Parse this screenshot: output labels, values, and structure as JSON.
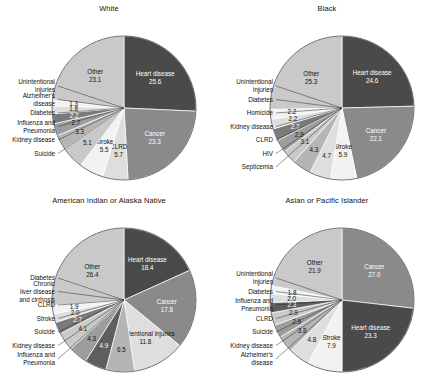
{
  "figure": {
    "type": "pie-grid",
    "rows": 2,
    "cols": 2,
    "background": "#ffffff",
    "value_unit": "percent"
  },
  "palette": {
    "heart_disease": "#4a4a4a",
    "cancer": "#8a8a8a",
    "other": "#c9c9c9",
    "very_light": "#f2f2f2",
    "light": "#dedede",
    "mid_light": "#b5b5b5",
    "mid": "#9d9d9d",
    "mid_dark": "#7a7a7a",
    "dark": "#5e5e5e",
    "outline": "#3a3a3a",
    "text_dark": "#111111",
    "text_light": "#ffffff"
  },
  "chart_data": [
    {
      "type": "pie",
      "title": "White",
      "xlabel": "",
      "ylabel": "",
      "start_angle_deg": 0,
      "direction": "clockwise",
      "categories": [
        "Heart disease",
        "Cancer",
        "CLRD",
        "Stroke",
        "Unintentional injuries",
        "Alzheimer's disease",
        "Diabetes",
        "Influenza and Pneumonia",
        "Kidney disease",
        "Suicide",
        "Other"
      ],
      "values": [
        25.6,
        23.3,
        5.7,
        5.5,
        5.1,
        3.3,
        2.7,
        2.2,
        1.8,
        1.3,
        23.1
      ],
      "slices": [
        {
          "label": "Heart disease",
          "value": 25.6,
          "value_text": "25.6",
          "color": "#4a4a4a",
          "label_place": "inside",
          "text_tone": "dark"
        },
        {
          "label": "Cancer",
          "value": 23.3,
          "value_text": "23.3",
          "color": "#8a8a8a",
          "label_place": "inside",
          "text_tone": "dark"
        },
        {
          "label": "CLRD",
          "value": 5.7,
          "value_text": "5.7",
          "color": "#dedede",
          "label_place": "inside",
          "text_tone": "light"
        },
        {
          "label": "Stroke",
          "value": 5.5,
          "value_text": "5.5",
          "color": "#f2f2f2",
          "label_place": "inside",
          "text_tone": "light"
        },
        {
          "label": "Unintentional injuries",
          "value": 5.1,
          "value_text": "5.1",
          "color": "#c9c9c9",
          "label_place": "outside",
          "text_tone": "light"
        },
        {
          "label": "Alzheimer's disease",
          "value": 3.3,
          "value_text": "3.3",
          "color": "#b5b5b5",
          "label_place": "outside",
          "text_tone": "light"
        },
        {
          "label": "Diabetes",
          "value": 2.7,
          "value_text": "2.7",
          "color": "#9d9d9d",
          "label_place": "outside",
          "text_tone": "light"
        },
        {
          "label": "Influenza and Pneumonia",
          "value": 2.2,
          "value_text": "2.2",
          "color": "#7a7a7a",
          "label_place": "outside",
          "text_tone": "dark"
        },
        {
          "label": "Kidney disease",
          "value": 1.8,
          "value_text": "1.8",
          "color": "#dedede",
          "label_place": "outside",
          "text_tone": "light"
        },
        {
          "label": "Suicide",
          "value": 1.3,
          "value_text": "1.3",
          "color": "#f2f2f2",
          "label_place": "outside",
          "text_tone": "light"
        },
        {
          "label": "Other",
          "value": 23.1,
          "value_text": "23.1",
          "color": "#c9c9c9",
          "label_place": "inside",
          "text_tone": "light"
        }
      ]
    },
    {
      "type": "pie",
      "title": "Black",
      "xlabel": "",
      "ylabel": "",
      "start_angle_deg": 0,
      "direction": "clockwise",
      "categories": [
        "Heart disease",
        "Cancer",
        "Stroke",
        "Unintentional injuries",
        "Diabetes",
        "Homicide",
        "Kidney disease",
        "CLRD",
        "HIV",
        "Septicemia",
        "Other"
      ],
      "values": [
        24.6,
        22.1,
        5.9,
        4.7,
        4.3,
        3.1,
        2.9,
        2.7,
        2.2,
        2.2,
        25.3
      ],
      "slices": [
        {
          "label": "Heart disease",
          "value": 24.6,
          "value_text": "24.6",
          "color": "#4a4a4a",
          "label_place": "inside",
          "text_tone": "dark"
        },
        {
          "label": "Cancer",
          "value": 22.1,
          "value_text": "22.1",
          "color": "#8a8a8a",
          "label_place": "inside",
          "text_tone": "dark"
        },
        {
          "label": "Stroke",
          "value": 5.9,
          "value_text": "5.9",
          "color": "#f2f2f2",
          "label_place": "inside",
          "text_tone": "light"
        },
        {
          "label": "Unintentional injuries",
          "value": 4.7,
          "value_text": "4.7",
          "color": "#dedede",
          "label_place": "outside",
          "text_tone": "light"
        },
        {
          "label": "Diabetes",
          "value": 4.3,
          "value_text": "4.3",
          "color": "#b5b5b5",
          "label_place": "outside",
          "text_tone": "light"
        },
        {
          "label": "Homicide",
          "value": 3.1,
          "value_text": "3.1",
          "color": "#c9c9c9",
          "label_place": "outside",
          "text_tone": "light"
        },
        {
          "label": "Kidney disease",
          "value": 2.9,
          "value_text": "2.9",
          "color": "#9d9d9d",
          "label_place": "outside",
          "text_tone": "light"
        },
        {
          "label": "CLRD",
          "value": 2.7,
          "value_text": "2.7",
          "color": "#7a7a7a",
          "label_place": "outside",
          "text_tone": "dark"
        },
        {
          "label": "HIV",
          "value": 2.2,
          "value_text": "2.2",
          "color": "#dedede",
          "label_place": "outside",
          "text_tone": "light"
        },
        {
          "label": "Septicemia",
          "value": 2.2,
          "value_text": "2.2",
          "color": "#f2f2f2",
          "label_place": "outside",
          "text_tone": "light"
        },
        {
          "label": "Other",
          "value": 25.3,
          "value_text": "25.3",
          "color": "#c9c9c9",
          "label_place": "inside",
          "text_tone": "light"
        }
      ]
    },
    {
      "type": "pie",
      "title": "American Indian or Alaska Native",
      "xlabel": "",
      "ylabel": "",
      "start_angle_deg": 0,
      "direction": "clockwise",
      "categories": [
        "Heart disease",
        "Cancer",
        "Unintentional injuries",
        "Diabetes",
        "Chronic liver disease and cirrhosis",
        "CLRD",
        "Stroke",
        "Suicide",
        "Kidney disease",
        "Influenza and Pneumonia",
        "Other"
      ],
      "values": [
        18.4,
        17.8,
        11.8,
        6.5,
        4.9,
        4.3,
        4.1,
        2.7,
        2.0,
        1.9,
        26.4
      ],
      "slices": [
        {
          "label": "Heart disease",
          "value": 18.4,
          "value_text": "18.4",
          "color": "#4a4a4a",
          "label_place": "inside",
          "text_tone": "dark"
        },
        {
          "label": "Cancer",
          "value": 17.8,
          "value_text": "17.8",
          "color": "#8a8a8a",
          "label_place": "inside",
          "text_tone": "dark"
        },
        {
          "label": "Unintentional injuries",
          "value": 11.8,
          "value_text": "11.8",
          "color": "#dedede",
          "label_place": "inside",
          "text_tone": "light"
        },
        {
          "label": "Diabetes",
          "value": 6.5,
          "value_text": "6.5",
          "color": "#b5b5b5",
          "label_place": "outside",
          "text_tone": "light"
        },
        {
          "label": "Chronic liver disease and cirrhosis",
          "value": 4.9,
          "value_text": "4.9",
          "color": "#5e5e5e",
          "label_place": "outside",
          "text_tone": "dark"
        },
        {
          "label": "CLRD",
          "value": 4.3,
          "value_text": "4.3",
          "color": "#9d9d9d",
          "label_place": "outside",
          "text_tone": "light"
        },
        {
          "label": "Stroke",
          "value": 4.1,
          "value_text": "4.1",
          "color": "#c9c9c9",
          "label_place": "outside",
          "text_tone": "light"
        },
        {
          "label": "Suicide",
          "value": 2.7,
          "value_text": "2.7",
          "color": "#7a7a7a",
          "label_place": "outside",
          "text_tone": "dark"
        },
        {
          "label": "Kidney disease",
          "value": 2.0,
          "value_text": "2.0",
          "color": "#dedede",
          "label_place": "outside",
          "text_tone": "light"
        },
        {
          "label": "Influenza and Pneumonia",
          "value": 1.9,
          "value_text": "1.9",
          "color": "#f2f2f2",
          "label_place": "outside",
          "text_tone": "light"
        },
        {
          "label": "Other",
          "value": 26.4,
          "value_text": "26.4",
          "color": "#c9c9c9",
          "label_place": "inside",
          "text_tone": "light"
        }
      ]
    },
    {
      "type": "pie",
      "title": "Asian or Pacific Islander",
      "xlabel": "",
      "ylabel": "",
      "start_angle_deg": 0,
      "direction": "clockwise",
      "categories": [
        "Cancer",
        "Heart disease",
        "Stroke",
        "Unintentional injuries",
        "Diabetes",
        "Influenza and Pneumonia",
        "CLRD",
        "Suicide",
        "Kidney disease",
        "Alzheimer's disease",
        "Other"
      ],
      "values": [
        27.0,
        23.3,
        7.9,
        4.8,
        3.8,
        2.9,
        2.9,
        2.3,
        2.0,
        1.8,
        21.9
      ],
      "slices": [
        {
          "label": "Cancer",
          "value": 27.0,
          "value_text": "27.0",
          "color": "#8a8a8a",
          "label_place": "inside",
          "text_tone": "dark"
        },
        {
          "label": "Heart disease",
          "value": 23.3,
          "value_text": "23.3",
          "color": "#4a4a4a",
          "label_place": "inside",
          "text_tone": "dark"
        },
        {
          "label": "Stroke",
          "value": 7.9,
          "value_text": "7.9",
          "color": "#f2f2f2",
          "label_place": "inside",
          "text_tone": "light"
        },
        {
          "label": "Unintentional injuries",
          "value": 4.8,
          "value_text": "4.8",
          "color": "#dedede",
          "label_place": "outside",
          "text_tone": "light"
        },
        {
          "label": "Diabetes",
          "value": 3.8,
          "value_text": "3.8",
          "color": "#b5b5b5",
          "label_place": "outside",
          "text_tone": "light"
        },
        {
          "label": "Influenza and Pneumonia",
          "value": 2.9,
          "value_text": "2.9",
          "color": "#9d9d9d",
          "label_place": "outside",
          "text_tone": "light"
        },
        {
          "label": "CLRD",
          "value": 2.9,
          "value_text": "2.9",
          "color": "#c9c9c9",
          "label_place": "outside",
          "text_tone": "light"
        },
        {
          "label": "Suicide",
          "value": 2.3,
          "value_text": "2.3",
          "color": "#5e5e5e",
          "label_place": "outside",
          "text_tone": "dark"
        },
        {
          "label": "Kidney disease",
          "value": 2.0,
          "value_text": "2.0",
          "color": "#dedede",
          "label_place": "outside",
          "text_tone": "light"
        },
        {
          "label": "Alzheimer's disease",
          "value": 1.8,
          "value_text": "1.8",
          "color": "#f2f2f2",
          "label_place": "outside",
          "text_tone": "light"
        },
        {
          "label": "Other",
          "value": 21.9,
          "value_text": "21.9",
          "color": "#c9c9c9",
          "label_place": "inside",
          "text_tone": "light"
        }
      ]
    }
  ]
}
